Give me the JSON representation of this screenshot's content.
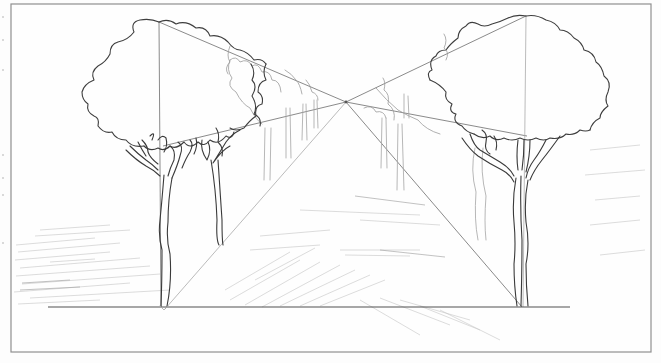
{
  "image": {
    "description": "Pencil sketch of a one-point perspective drawing: two large trees framing an avenue of smaller receding trees, with perspective guide lines converging to a central vanishing point above a horizontal ground line.",
    "subject": "Tree-lined avenue in one-point perspective",
    "medium": "pencil on paper",
    "colors": {
      "paper": "#fdfdfd",
      "frame": "#8f8f8f",
      "guide_lines": "#7d7d7d",
      "outline": "#3e3e3e",
      "shading": "#c4c4c4"
    },
    "elements": {
      "frame": "rectangular border",
      "vanishing_point": "central convergence point",
      "ground_line": "horizontal baseline",
      "left_tree": "large foreground tree on left",
      "right_tree": "large foreground tree on right",
      "receding_trees": "smaller trees diminishing toward vanishing point",
      "shading": "diagonal pencil hatching on ground"
    }
  }
}
